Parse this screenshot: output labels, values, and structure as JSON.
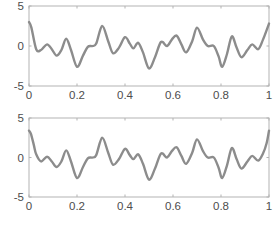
{
  "chart_data": [
    {
      "type": "line",
      "title": "",
      "xlabel": "",
      "ylabel": "",
      "xlim": [
        0,
        1
      ],
      "ylim": [
        -5,
        5
      ],
      "grid": false,
      "legend": null,
      "xticks": [
        0,
        0.2,
        0.4,
        0.6,
        0.8,
        1
      ],
      "xtick_labels": [
        "0",
        "0.2",
        "0.4",
        "0.6",
        "0.8",
        "1"
      ],
      "yticks": [
        -5,
        0,
        5
      ],
      "ytick_labels": [
        "-5",
        "0",
        "5"
      ],
      "line_color": "#8c8c8c",
      "series": [
        {
          "name": "signal",
          "x": [
            0,
            0.01,
            0.03,
            0.05,
            0.075,
            0.095,
            0.115,
            0.135,
            0.155,
            0.175,
            0.2,
            0.225,
            0.245,
            0.265,
            0.28,
            0.305,
            0.33,
            0.35,
            0.375,
            0.4,
            0.42,
            0.435,
            0.455,
            0.475,
            0.5,
            0.525,
            0.55,
            0.575,
            0.595,
            0.615,
            0.635,
            0.655,
            0.68,
            0.7,
            0.725,
            0.745,
            0.77,
            0.79,
            0.805,
            0.825,
            0.845,
            0.865,
            0.885,
            0.91,
            0.93,
            0.955,
            0.975,
            1.0
          ],
          "y": [
            3.0,
            2.3,
            -0.4,
            -0.5,
            0.2,
            -0.4,
            -1.2,
            -0.5,
            0.9,
            -0.5,
            -2.6,
            -1.2,
            -0.1,
            0.0,
            0.3,
            2.5,
            0.6,
            -0.9,
            -0.2,
            1.1,
            0.3,
            -0.3,
            0.4,
            -0.8,
            -2.8,
            -1.4,
            0.5,
            0.0,
            0.8,
            1.3,
            0.2,
            -0.8,
            0.6,
            2.3,
            0.8,
            0.0,
            0.0,
            -1.3,
            -2.6,
            -1.0,
            1.2,
            -0.2,
            -1.4,
            -0.5,
            0.2,
            -0.4,
            0.8,
            2.8
          ]
        }
      ]
    },
    {
      "type": "line",
      "title": "",
      "xlabel": "",
      "ylabel": "",
      "xlim": [
        0,
        1
      ],
      "ylim": [
        -5,
        5
      ],
      "grid": false,
      "legend": null,
      "xticks": [
        0,
        0.2,
        0.4,
        0.6,
        0.8,
        1
      ],
      "xtick_labels": [
        "0",
        "0.2",
        "0.4",
        "0.6",
        "0.8",
        "1"
      ],
      "yticks": [
        -5,
        0,
        5
      ],
      "ytick_labels": [
        "-5",
        "0",
        "5"
      ],
      "line_color": "#8c8c8c",
      "series": [
        {
          "name": "signal",
          "x": [
            0,
            0.008,
            0.02,
            0.03,
            0.05,
            0.075,
            0.095,
            0.115,
            0.135,
            0.155,
            0.175,
            0.2,
            0.225,
            0.245,
            0.265,
            0.28,
            0.305,
            0.33,
            0.35,
            0.375,
            0.4,
            0.42,
            0.435,
            0.455,
            0.475,
            0.5,
            0.525,
            0.55,
            0.575,
            0.595,
            0.615,
            0.635,
            0.655,
            0.68,
            0.7,
            0.725,
            0.745,
            0.77,
            0.79,
            0.805,
            0.825,
            0.845,
            0.865,
            0.885,
            0.91,
            0.93,
            0.955,
            0.975,
            0.99,
            1.0
          ],
          "y": [
            3.4,
            3.0,
            1.6,
            0.4,
            -0.5,
            0.1,
            -0.5,
            -1.2,
            -0.5,
            0.9,
            -0.5,
            -2.6,
            -1.2,
            -0.1,
            0.0,
            0.3,
            2.5,
            0.6,
            -0.9,
            -0.2,
            1.1,
            0.3,
            -0.2,
            0.4,
            -0.8,
            -2.8,
            -1.4,
            0.5,
            0.0,
            0.8,
            1.3,
            0.2,
            -0.8,
            0.6,
            2.3,
            0.8,
            0.0,
            0.0,
            -1.3,
            -2.6,
            -1.0,
            1.2,
            -0.2,
            -1.4,
            -0.5,
            0.2,
            -0.4,
            0.5,
            1.8,
            3.4
          ]
        }
      ]
    }
  ]
}
